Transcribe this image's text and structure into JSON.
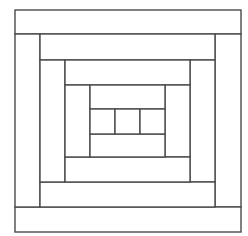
{
  "diagram": {
    "type": "log-cabin-quilt-block",
    "stroke_color": "#4a4a4a",
    "fill_color": "#ffffff",
    "outer_square": {
      "x": 15,
      "y": 10,
      "w": 226,
      "h": 222
    },
    "pieces": [
      {
        "name": "outer-top-strip",
        "x": 15,
        "y": 10,
        "w": 226,
        "h": 24
      },
      {
        "name": "outer-right-strip",
        "x": 215,
        "y": 34,
        "w": 26,
        "h": 173
      },
      {
        "name": "outer-bottom-strip",
        "x": 15,
        "y": 207,
        "w": 226,
        "h": 25
      },
      {
        "name": "outer-left-strip",
        "x": 15,
        "y": 34,
        "w": 25,
        "h": 173
      },
      {
        "name": "ring2-top-strip",
        "x": 40,
        "y": 34,
        "w": 175,
        "h": 26
      },
      {
        "name": "ring2-right-strip",
        "x": 190,
        "y": 60,
        "w": 25,
        "h": 122
      },
      {
        "name": "ring2-bottom-strip",
        "x": 40,
        "y": 182,
        "w": 175,
        "h": 25
      },
      {
        "name": "ring2-left-strip",
        "x": 40,
        "y": 60,
        "w": 25,
        "h": 122
      },
      {
        "name": "ring3-top-strip",
        "x": 65,
        "y": 60,
        "w": 125,
        "h": 25
      },
      {
        "name": "ring3-right-strip",
        "x": 165,
        "y": 85,
        "w": 25,
        "h": 72
      },
      {
        "name": "ring3-bottom-strip",
        "x": 65,
        "y": 157,
        "w": 125,
        "h": 25
      },
      {
        "name": "ring3-left-strip",
        "x": 65,
        "y": 85,
        "w": 25,
        "h": 72
      },
      {
        "name": "ring4-top-strip",
        "x": 90,
        "y": 85,
        "w": 75,
        "h": 24
      },
      {
        "name": "ring4-bottom-strip",
        "x": 90,
        "y": 134,
        "w": 75,
        "h": 23
      },
      {
        "name": "center-left-square",
        "x": 90,
        "y": 109,
        "w": 25,
        "h": 25
      },
      {
        "name": "center-square",
        "x": 115,
        "y": 109,
        "w": 25,
        "h": 25
      },
      {
        "name": "center-right-square",
        "x": 140,
        "y": 109,
        "w": 25,
        "h": 25
      }
    ]
  }
}
